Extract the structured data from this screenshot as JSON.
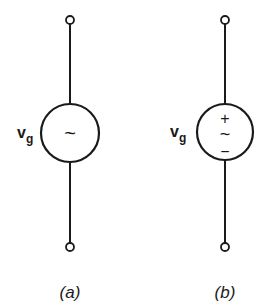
{
  "diagram": {
    "stroke_color": "#1a1a1a",
    "background": "#ffffff",
    "sources": [
      {
        "id": "a",
        "caption": "(a)",
        "label": "v",
        "label_subscript": "g",
        "symbol": "~",
        "polarity_plus": "",
        "polarity_minus": ""
      },
      {
        "id": "b",
        "caption": "(b)",
        "label": "v",
        "label_subscript": "g",
        "symbol": "~",
        "polarity_plus": "+",
        "polarity_minus": "−"
      }
    ]
  }
}
